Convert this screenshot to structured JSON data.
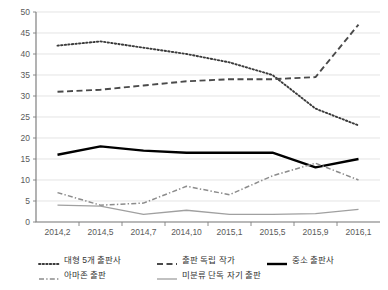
{
  "chart_data": {
    "type": "line",
    "title": "",
    "xlabel": "",
    "ylabel": "",
    "categories": [
      "2014,2",
      "2014,5",
      "2014,7",
      "2014,10",
      "2015,1",
      "2015,5",
      "2015,9",
      "2016,1"
    ],
    "ylim": [
      0,
      50
    ],
    "ytick_values": [
      "0",
      "5",
      "10",
      "15",
      "20",
      "25",
      "30",
      "35",
      "40",
      "45",
      "50"
    ],
    "grid": true,
    "legend_position": "bottom",
    "series": [
      {
        "name": "대형 5개 출판사",
        "style": "dotted",
        "color": "#3a3a3a",
        "values": [
          42,
          43,
          41.5,
          40,
          38,
          35,
          27,
          23
        ]
      },
      {
        "name": "출판 독립 작가",
        "style": "dashed",
        "color": "#4a4a4a",
        "values": [
          31,
          31.5,
          32.5,
          33.5,
          34,
          34,
          34.5,
          47
        ]
      },
      {
        "name": "중소 출판사",
        "style": "solid-thick",
        "color": "#000000",
        "values": [
          16,
          18,
          17,
          16.5,
          16.5,
          16.5,
          13,
          15
        ]
      },
      {
        "name": "아마존 출판",
        "style": "dash-dot",
        "color": "#8c8c8c",
        "values": [
          7,
          4,
          4.5,
          8.5,
          6.5,
          11,
          14,
          10
        ]
      },
      {
        "name": "미분류 단독 자기 출판",
        "style": "solid-thin",
        "color": "#a0a0a0",
        "values": [
          4,
          3.8,
          1.8,
          2.8,
          1.8,
          1.8,
          2,
          3
        ]
      }
    ]
  },
  "legend": {
    "rows": [
      [
        {
          "label": "대형 5개 출판사",
          "style": "dotted"
        },
        {
          "label": "출판 독립 작가",
          "style": "dashed"
        },
        {
          "label": "중소 출판사",
          "style": "solid-thick"
        }
      ],
      [
        {
          "label": "아마존 출판",
          "style": "dash-dot"
        },
        {
          "label": "미분류 단독 자기 출판",
          "style": "solid-thin"
        }
      ]
    ]
  }
}
